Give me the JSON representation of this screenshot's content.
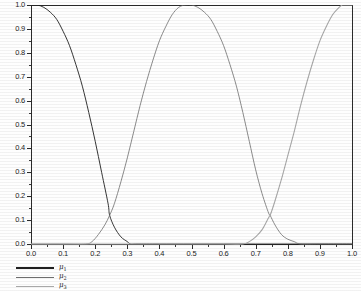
{
  "chart_data": {
    "type": "line",
    "title": "",
    "xlabel": "",
    "ylabel": "",
    "xlim": [
      0.0,
      1.0
    ],
    "ylim": [
      0.0,
      1.0
    ],
    "grid": false,
    "legend_position": "below-left",
    "x_ticks": [
      "0.0",
      "0.1",
      "0.2",
      "0.3",
      "0.4",
      "0.5",
      "0.6",
      "0.7",
      "0.8",
      "0.9",
      "1.0"
    ],
    "x_tick_values": [
      0.0,
      0.1,
      0.2,
      0.3,
      0.4,
      0.5,
      0.6,
      0.7,
      0.8,
      0.9,
      1.0
    ],
    "y_ticks": [
      "0.0",
      "0.1",
      "0.2",
      "0.3",
      "0.4",
      "0.5",
      "0.6",
      "0.7",
      "0.8",
      "0.9",
      "1.0"
    ],
    "y_tick_values": [
      0.0,
      0.1,
      0.2,
      0.3,
      0.4,
      0.5,
      0.6,
      0.7,
      0.8,
      0.9,
      1.0
    ],
    "series": [
      {
        "name": "μ₁",
        "label_base": "μ",
        "label_sub": "1",
        "color": "#1f1f1f",
        "x": [
          0.0,
          0.02,
          0.04,
          0.06,
          0.08,
          0.1,
          0.12,
          0.14,
          0.16,
          0.18,
          0.2,
          0.22,
          0.24,
          0.245,
          0.26,
          0.28,
          0.3,
          0.31,
          0.33,
          0.4,
          0.5,
          0.6,
          0.7,
          0.8,
          0.9,
          1.0
        ],
        "values": [
          1.0,
          1.0,
          0.99,
          0.97,
          0.94,
          0.89,
          0.83,
          0.75,
          0.66,
          0.55,
          0.43,
          0.3,
          0.17,
          0.12,
          0.07,
          0.03,
          0.01,
          0.0,
          0.0,
          0.0,
          0.0,
          0.0,
          0.0,
          0.0,
          0.0,
          0.0
        ]
      },
      {
        "name": "μ₂",
        "label_base": "μ",
        "label_sub": "2",
        "color": "#6e6e6e",
        "x": [
          0.0,
          0.1,
          0.17,
          0.19,
          0.21,
          0.23,
          0.245,
          0.26,
          0.28,
          0.3,
          0.32,
          0.34,
          0.36,
          0.38,
          0.4,
          0.42,
          0.44,
          0.46,
          0.48,
          0.5,
          0.52,
          0.54,
          0.56,
          0.58,
          0.6,
          0.62,
          0.64,
          0.66,
          0.68,
          0.7,
          0.72,
          0.74,
          0.745,
          0.76,
          0.78,
          0.8,
          0.82,
          0.84,
          0.9,
          1.0
        ],
        "values": [
          0.0,
          0.0,
          0.0,
          0.01,
          0.04,
          0.08,
          0.12,
          0.17,
          0.26,
          0.36,
          0.47,
          0.58,
          0.68,
          0.77,
          0.85,
          0.91,
          0.96,
          0.99,
          1.0,
          1.0,
          0.99,
          0.97,
          0.94,
          0.89,
          0.83,
          0.75,
          0.66,
          0.55,
          0.43,
          0.31,
          0.21,
          0.13,
          0.12,
          0.08,
          0.04,
          0.02,
          0.01,
          0.0,
          0.0,
          0.0
        ]
      },
      {
        "name": "μ₃",
        "label_base": "μ",
        "label_sub": "3",
        "color": "#a8a8a8",
        "x": [
          0.0,
          0.2,
          0.4,
          0.6,
          0.66,
          0.68,
          0.7,
          0.72,
          0.74,
          0.745,
          0.76,
          0.78,
          0.8,
          0.82,
          0.84,
          0.86,
          0.88,
          0.9,
          0.92,
          0.94,
          0.96,
          0.97,
          0.98,
          1.0
        ],
        "values": [
          0.0,
          0.0,
          0.0,
          0.0,
          0.0,
          0.01,
          0.03,
          0.06,
          0.11,
          0.12,
          0.18,
          0.27,
          0.37,
          0.47,
          0.58,
          0.68,
          0.77,
          0.85,
          0.91,
          0.96,
          0.99,
          1.0,
          1.0,
          1.0
        ]
      }
    ],
    "annotations": [
      {
        "text": "μ₁ and μ₂ cross near x = 0.245, y = 0.12"
      },
      {
        "text": "μ₂ and μ₃ cross near x = 0.745, y = 0.12"
      },
      {
        "text": "μ₂ peaks at y = 1.00 near x = 0.49"
      }
    ]
  },
  "legend": {
    "items": [
      {
        "label_base": "μ",
        "label_sub": "1",
        "style": "s1"
      },
      {
        "label_base": "μ",
        "label_sub": "2",
        "style": "s2"
      },
      {
        "label_base": "μ",
        "label_sub": "3",
        "style": "s3"
      }
    ]
  }
}
